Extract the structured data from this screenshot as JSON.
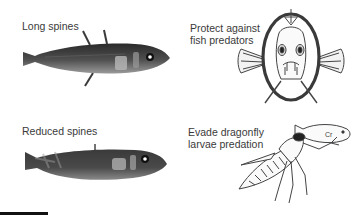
{
  "panels": [
    {
      "id": "long-spines",
      "label": "Long spines"
    },
    {
      "id": "fish-predators",
      "label_lines": [
        "Protect against",
        "fish predators"
      ]
    },
    {
      "id": "reduced-spines",
      "label": "Reduced spines"
    },
    {
      "id": "dragonfly",
      "label_lines": [
        "Evade dragonfly",
        "larvae predation"
      ]
    }
  ],
  "colors": {
    "fish_dark": "#2e2e2e",
    "fish_mid": "#6b6b6b",
    "fish_light": "#bdbdbd",
    "line_art": "#444444",
    "scale_bar": "#111111"
  },
  "scale_bar": {
    "visible": true
  }
}
